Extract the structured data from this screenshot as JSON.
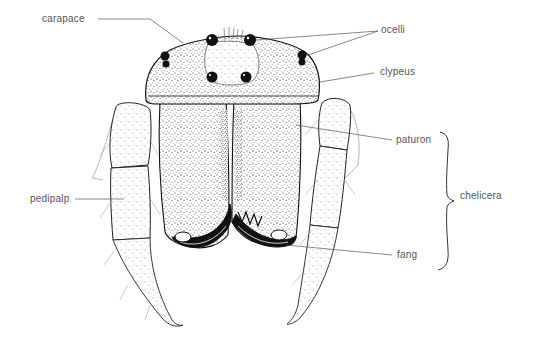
{
  "diagram": {
    "colors": {
      "ink": "#111111",
      "leader_line": "#555555",
      "label_text": "#555555",
      "background": "#ffffff"
    },
    "labels": {
      "carapace": "carapace",
      "ocelli": "ocelli",
      "clypeus": "clypeus",
      "paturon": "paturon",
      "chelicera": "chelicera",
      "pedipalp": "pedipalp",
      "fang": "fang"
    }
  }
}
